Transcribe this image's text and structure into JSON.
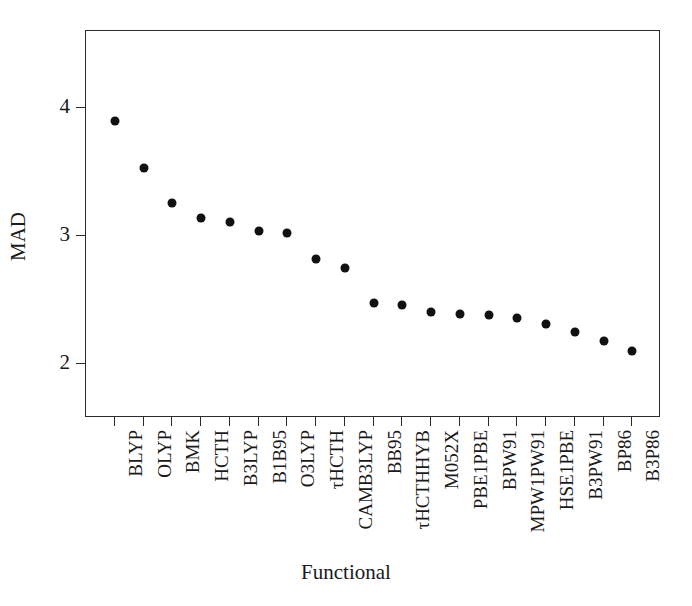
{
  "chart_data": {
    "type": "scatter",
    "title": "",
    "xlabel": "Functional",
    "ylabel": "MAD",
    "categories": [
      "BLYP",
      "OLYP",
      "BMK",
      "HCTH",
      "B3LYP",
      "B1B95",
      "O3LYP",
      "τHCTH",
      "CAMB3LYP",
      "BB95",
      "τHCTHHYB",
      "M052X",
      "PBE1PBE",
      "BPW91",
      "MPW1PW91",
      "HSE1PBE",
      "B3PW91",
      "BP86",
      "B3P86"
    ],
    "values": [
      3.9,
      3.53,
      3.26,
      3.14,
      3.11,
      3.04,
      3.02,
      2.82,
      2.75,
      2.48,
      2.46,
      2.41,
      2.39,
      2.38,
      2.36,
      2.31,
      2.25,
      2.18,
      2.1
    ],
    "ylim": [
      1.58,
      4.6
    ],
    "yticks": [
      2,
      3,
      4
    ],
    "ytick_labels": [
      "2",
      "3",
      "4"
    ],
    "grid": false,
    "legend": null,
    "marker": "filled-circle",
    "marker_color": "#111111",
    "frame_color": "#2b2b2b",
    "background": "#ffffff"
  },
  "axes": {
    "y_axis_title": "MAD",
    "x_axis_title": "Functional"
  }
}
